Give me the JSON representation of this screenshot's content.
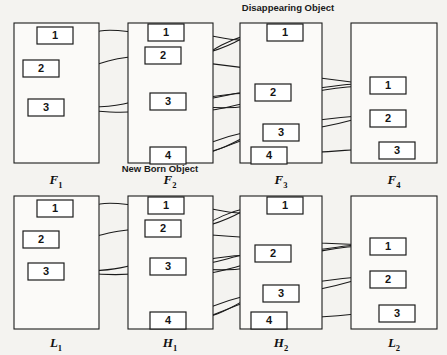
{
  "figure": {
    "background_color": "#f4f3f0",
    "stroke_color": "#1a1a1a",
    "box_fill": "#ffffff"
  },
  "annotations": [
    {
      "id": "disappearing",
      "text": "Disappearing Object",
      "x": 288,
      "y": 11
    },
    {
      "id": "newborn",
      "text": "New Born Object",
      "x": 160,
      "y": 172
    }
  ],
  "panels": [
    {
      "id": "F1",
      "label": "F",
      "sublabel": "1",
      "label_x": 56,
      "label_y": 184,
      "rect": {
        "x": 14,
        "y": 23,
        "w": 85,
        "h": 140
      },
      "objects": [
        {
          "label": "1",
          "x": 37,
          "y": 27,
          "w": 36,
          "h": 17
        },
        {
          "label": "2",
          "x": 23,
          "y": 60,
          "w": 36,
          "h": 17
        },
        {
          "label": "3",
          "x": 28,
          "y": 99,
          "w": 36,
          "h": 17
        }
      ]
    },
    {
      "id": "F2",
      "label": "F",
      "sublabel": "2",
      "label_x": 170,
      "label_y": 184,
      "rect": {
        "x": 128,
        "y": 23,
        "w": 85,
        "h": 140
      },
      "objects": [
        {
          "label": "1",
          "x": 148,
          "y": 24,
          "w": 36,
          "h": 17
        },
        {
          "label": "2",
          "x": 145,
          "y": 47,
          "w": 36,
          "h": 17
        },
        {
          "label": "3",
          "x": 150,
          "y": 93,
          "w": 36,
          "h": 17
        },
        {
          "label": "4",
          "x": 150,
          "y": 147,
          "w": 36,
          "h": 17
        }
      ]
    },
    {
      "id": "F3",
      "label": "F",
      "sublabel": "3",
      "label_x": 281,
      "label_y": 184,
      "rect": {
        "x": 240,
        "y": 23,
        "w": 82,
        "h": 140
      },
      "objects": [
        {
          "label": "1",
          "x": 267,
          "y": 24,
          "w": 36,
          "h": 17
        },
        {
          "label": "2",
          "x": 255,
          "y": 84,
          "w": 36,
          "h": 17
        },
        {
          "label": "3",
          "x": 263,
          "y": 124,
          "w": 36,
          "h": 17
        },
        {
          "label": "4",
          "x": 251,
          "y": 147,
          "w": 36,
          "h": 17
        }
      ]
    },
    {
      "id": "F4",
      "label": "F",
      "sublabel": "4",
      "label_x": 394,
      "label_y": 184,
      "rect": {
        "x": 351,
        "y": 23,
        "w": 86,
        "h": 140
      },
      "objects": [
        {
          "label": "1",
          "x": 370,
          "y": 77,
          "w": 36,
          "h": 17
        },
        {
          "label": "2",
          "x": 370,
          "y": 110,
          "w": 36,
          "h": 17
        },
        {
          "label": "3",
          "x": 379,
          "y": 142,
          "w": 36,
          "h": 17
        }
      ]
    },
    {
      "id": "L1",
      "label": "L",
      "sublabel": "1",
      "label_x": 56,
      "label_y": 347,
      "rect": {
        "x": 14,
        "y": 196,
        "w": 85,
        "h": 133
      },
      "objects": [
        {
          "label": "1",
          "x": 37,
          "y": 200,
          "w": 36,
          "h": 17
        },
        {
          "label": "2",
          "x": 23,
          "y": 231,
          "w": 36,
          "h": 17
        },
        {
          "label": "3",
          "x": 28,
          "y": 263,
          "w": 36,
          "h": 17
        }
      ]
    },
    {
      "id": "H1",
      "label": "H",
      "sublabel": "1",
      "label_x": 170,
      "label_y": 347,
      "rect": {
        "x": 128,
        "y": 196,
        "w": 85,
        "h": 133
      },
      "objects": [
        {
          "label": "1",
          "x": 148,
          "y": 197,
          "w": 36,
          "h": 17
        },
        {
          "label": "2",
          "x": 145,
          "y": 220,
          "w": 36,
          "h": 17
        },
        {
          "label": "3",
          "x": 150,
          "y": 258,
          "w": 36,
          "h": 17
        },
        {
          "label": "4",
          "x": 150,
          "y": 312,
          "w": 36,
          "h": 17
        }
      ]
    },
    {
      "id": "H2",
      "label": "H",
      "sublabel": "2",
      "label_x": 281,
      "label_y": 347,
      "rect": {
        "x": 240,
        "y": 196,
        "w": 82,
        "h": 133
      },
      "objects": [
        {
          "label": "1",
          "x": 267,
          "y": 197,
          "w": 36,
          "h": 17
        },
        {
          "label": "2",
          "x": 255,
          "y": 245,
          "w": 36,
          "h": 17
        },
        {
          "label": "3",
          "x": 263,
          "y": 285,
          "w": 36,
          "h": 17
        },
        {
          "label": "4",
          "x": 251,
          "y": 312,
          "w": 36,
          "h": 17
        }
      ]
    },
    {
      "id": "L2",
      "label": "L",
      "sublabel": "2",
      "label_x": 394,
      "label_y": 347,
      "rect": {
        "x": 351,
        "y": 196,
        "w": 86,
        "h": 133
      },
      "objects": [
        {
          "label": "1",
          "x": 370,
          "y": 238,
          "w": 36,
          "h": 17
        },
        {
          "label": "2",
          "x": 370,
          "y": 271,
          "w": 36,
          "h": 17
        },
        {
          "label": "3",
          "x": 379,
          "y": 305,
          "w": 36,
          "h": 17
        }
      ]
    }
  ],
  "links": [
    {
      "id": "t-f2-1-to-f1-1",
      "path": "M 148 33 C 130 33 115 28 100 31 L 77 35",
      "arrow": true
    },
    {
      "id": "t-f2-2-to-f1-2",
      "path": "M 145 56 C 120 56 105 62 88 67 L 63 69",
      "arrow": true
    },
    {
      "id": "t-f3-1-to-f1-3",
      "path": "M 267 33 C 220 33 190 70 150 95 C 130 105 110 107 92 107",
      "arrow": true
    },
    {
      "id": "t-f3-2-to-f1-3",
      "path": "M 255 93 C 210 93 185 104 150 110 C 125 114 105 112 86 110",
      "arrow": true
    },
    {
      "id": "t-f2-1-to-f3-1",
      "path": "M 184 33 C 210 33 222 40 240 40 L 263 33",
      "arrow": true
    },
    {
      "id": "t-f2-2-to-f3-1b",
      "path": "M 181 56 C 205 56 225 48 243 38 L 263 31",
      "arrow": true
    },
    {
      "id": "t-f3-1-to-f3-2",
      "path": "M 281 41 C 281 58 272 72 262 82 L 253 89",
      "arrow": true
    },
    {
      "id": "t-f2-3-to-f3-2",
      "path": "M 186 101 C 205 101 222 96 238 93 L 251 92",
      "arrow": true
    },
    {
      "id": "t-f3-2-to-f2-3",
      "path": "M 255 101 C 230 106 215 112 198 110 L 188 106",
      "arrow": true
    },
    {
      "id": "t-f4-1-to-f2-3",
      "path": "M 370 86 C 330 86 300 95 255 105 C 225 110 205 108 188 104",
      "arrow": true
    },
    {
      "id": "t-f2-4-to-f3-3",
      "path": "M 186 155 C 215 155 235 142 252 133 L 262 130",
      "arrow": true
    },
    {
      "id": "t-f3-3-to-f2-4",
      "path": "M 263 133 C 235 142 215 152 198 156 L 188 156",
      "arrow": true
    },
    {
      "id": "t-f2-3-down-f2-4",
      "path": "M 170 110 C 170 125 166 138 164 147",
      "arrow": true
    },
    {
      "id": "t-f3-2-to-f4-1",
      "path": "M 291 90 C 320 90 340 84 356 84 L 367 85",
      "arrow": true
    },
    {
      "id": "t-f2-2-to-f4-1",
      "path": "M 181 60 C 230 66 280 72 320 78 L 367 84",
      "arrow": true
    },
    {
      "id": "t-f3-3-to-f4-2",
      "path": "M 299 130 C 325 128 345 122 360 118 L 367 117",
      "arrow": true
    },
    {
      "id": "t-f3-4-to-f4-3",
      "path": "M 287 153 C 320 153 345 150 365 149 L 376 150",
      "arrow": true
    },
    {
      "id": "t-f4-2-long",
      "path": "M 370 115 C 330 118 300 122 270 127 C 240 132 215 140 192 150",
      "arrow": false
    },
    {
      "id": "b-h1-1-to-l1-1",
      "path": "M 148 206 C 130 206 115 201 100 204 L 77 208",
      "arrow": true
    },
    {
      "id": "b-h1-2-to-l1-2",
      "path": "M 145 229 C 120 229 105 234 88 238 L 63 240",
      "arrow": true
    },
    {
      "id": "b-h2-1-to-l1-3",
      "path": "M 267 206 C 220 206 190 238 150 258 C 130 268 110 270 92 271",
      "arrow": true
    },
    {
      "id": "b-h2-2-to-l1-3",
      "path": "M 255 255 C 210 255 185 266 150 272 C 125 276 105 275 86 273",
      "arrow": true
    },
    {
      "id": "b-h1-1-to-h2-1",
      "path": "M 184 206 C 210 206 222 213 240 213 L 263 206",
      "arrow": true
    },
    {
      "id": "b-h1-2-to-h2-1b",
      "path": "M 181 229 C 205 229 225 221 243 211 L 263 204",
      "arrow": true
    },
    {
      "id": "b-h2-1-to-h2-2",
      "path": "M 281 214 C 281 231 272 239 262 245 L 253 251",
      "arrow": true
    },
    {
      "id": "b-h1-3-to-h2-2",
      "path": "M 186 266 C 205 266 222 260 238 256 L 251 254",
      "arrow": true
    },
    {
      "id": "b-h2-2-to-h1-3",
      "path": "M 255 262 C 230 268 215 274 198 274 L 188 270",
      "arrow": true
    },
    {
      "id": "b-l2-1-to-h1-3",
      "path": "M 370 246 C 330 246 300 256 255 267 C 225 272 205 270 188 267",
      "arrow": true
    },
    {
      "id": "b-h1-4-to-h2-3",
      "path": "M 186 320 C 215 320 235 305 252 296 L 262 292",
      "arrow": true
    },
    {
      "id": "b-h2-3-to-h1-4",
      "path": "M 263 296 C 235 305 215 315 198 320 L 188 321",
      "arrow": true
    },
    {
      "id": "b-h1-3-down-h1-4",
      "path": "M 170 275 C 170 292 166 303 164 312",
      "arrow": true
    },
    {
      "id": "b-h2-2-to-l2-1",
      "path": "M 291 251 C 320 251 340 246 356 245 L 367 246",
      "arrow": true
    },
    {
      "id": "b-h1-2-to-l2-1",
      "path": "M 181 233 C 230 236 280 240 320 243 L 367 245",
      "arrow": true
    },
    {
      "id": "b-h2-3-to-l2-2",
      "path": "M 299 292 C 325 290 345 283 360 279 L 367 278",
      "arrow": true
    },
    {
      "id": "b-h2-4-to-l2-3",
      "path": "M 287 318 C 320 318 345 315 365 313 L 376 313",
      "arrow": true
    },
    {
      "id": "b-l2-2-long",
      "path": "M 370 276 C 330 279 300 284 270 290 C 240 296 215 304 192 315",
      "arrow": false
    }
  ]
}
